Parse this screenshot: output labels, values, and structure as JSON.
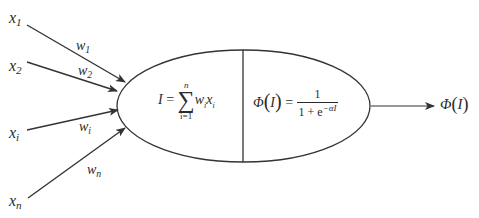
{
  "diagram": {
    "colors": {
      "stroke": "#333333",
      "text": "#2b2b2b",
      "background": "#ffffff"
    },
    "inputs": [
      {
        "name": "x",
        "sub": "1",
        "weight_name": "w",
        "weight_sub": "1"
      },
      {
        "name": "x",
        "sub": "2",
        "weight_name": "w",
        "weight_sub": "2"
      },
      {
        "name": "x",
        "sub": "i",
        "weight_name": "w",
        "weight_sub": "i"
      },
      {
        "name": "x",
        "sub": "n",
        "weight_name": "w",
        "weight_sub": "n"
      }
    ],
    "summation": {
      "lhs": "I",
      "equals": "=",
      "sum_symbol": "∑",
      "upper": "n",
      "lower": "i=1",
      "term_w": "w",
      "term_w_sub": "i",
      "term_x": "x",
      "term_x_sub": "i"
    },
    "activation": {
      "phi": "Φ",
      "open": "(",
      "arg": "I",
      "close": ")",
      "equals": "=",
      "numerator": "1",
      "denominator_base": "1 + e",
      "denominator_exp": "−αI"
    },
    "output": {
      "phi": "Φ",
      "open": "(",
      "arg": "I",
      "close": ")"
    }
  }
}
